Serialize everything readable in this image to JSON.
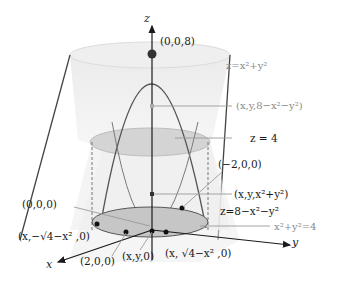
{
  "diagram": {
    "axes": {
      "x": "x",
      "y": "y",
      "z": "z"
    },
    "surfaces": {
      "paraboloid_up": "z=x²+y²",
      "paraboloid_down": "z=8−x²−y²",
      "plane": "z = 4",
      "circle": "x²+y²=4"
    },
    "points": {
      "top": "(0,0,8)",
      "upper_surface_point": "(x,y,8−x²−y²)",
      "neg2": "(−2,0,0)",
      "lower_surface_point": "(x,y,x²+y²)",
      "origin": "(0,0,0)",
      "minus_sqrt": "(x,−√4−x² ,0)",
      "two": "(2,0,0)",
      "xy0": "(x,y,0)",
      "plus_sqrt": "(x, √4−x² ,0)"
    },
    "colors": {
      "surface_fill": "#e6e6e6",
      "disk_fill": "#c8c8c8",
      "curve": "#555555",
      "leader": "#9a9a9a",
      "text": "#1a1a1a",
      "text_gray": "#8a8a8a"
    }
  }
}
